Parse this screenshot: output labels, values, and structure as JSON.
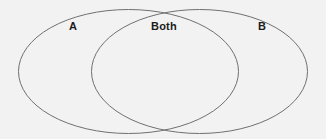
{
  "diagram": {
    "type": "venn-two-set",
    "background_color": "#f2f2f2",
    "stroke_color": "#707070",
    "stroke_width": 1,
    "text_color": "#1c1c1c",
    "labels": {
      "left_set": "A",
      "intersection": "Both",
      "right_set": "B"
    },
    "shapes": {
      "left_ellipse": {
        "cx": 128.5,
        "cy": 71.5,
        "rx": 110,
        "ry": 62
      },
      "right_ellipse": {
        "cx": 199.5,
        "cy": 71.5,
        "rx": 108,
        "ry": 62
      }
    }
  }
}
